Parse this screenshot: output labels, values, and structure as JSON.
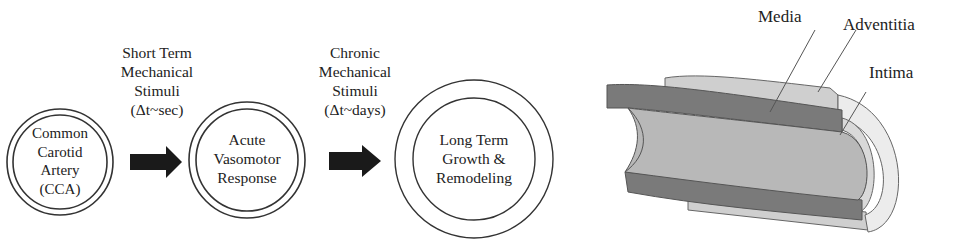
{
  "flow": {
    "nodes": [
      {
        "id": "cca",
        "lines": [
          "Common",
          "Carotid",
          "Artery",
          "(CCA)"
        ]
      },
      {
        "id": "acute",
        "lines": [
          "Acute",
          "Vasomotor",
          "Response"
        ]
      },
      {
        "id": "longterm",
        "lines": [
          "Long Term",
          "Growth &",
          "Remodeling"
        ]
      }
    ],
    "stimuli": [
      {
        "id": "short",
        "lines": [
          "Short Term",
          "Mechanical",
          "Stimuli",
          "(Δt~sec)"
        ]
      },
      {
        "id": "chronic",
        "lines": [
          "Chronic",
          "Mechanical",
          "Stimuli",
          "(Δt~days)"
        ]
      }
    ],
    "arrow_icon": "right-arrow-icon"
  },
  "vessel": {
    "labels": {
      "media": "Media",
      "adventitia": "Adventitia",
      "intima": "Intima"
    },
    "colors": {
      "media": "#7a7a7a",
      "adventitia": "#cfcfcf",
      "intima_lumen": "#b5b5b5",
      "outline": "#555555"
    }
  }
}
